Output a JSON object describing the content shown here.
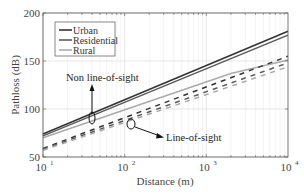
{
  "chart_data": {
    "type": "line",
    "title": "",
    "xlabel": "Distance (m)",
    "ylabel": "Pathloss (dB)",
    "xscale": "log",
    "xlim": [
      10,
      10000
    ],
    "ylim": [
      50,
      200
    ],
    "xticks": [
      10,
      100,
      1000,
      10000
    ],
    "xtick_labels": [
      "10",
      "10",
      "10",
      "10"
    ],
    "xtick_exponents": [
      "1",
      "2",
      "3",
      "4"
    ],
    "yticks": [
      50,
      100,
      150,
      200
    ],
    "ytick_labels": [
      "50",
      "100",
      "150",
      "200"
    ],
    "grid": true,
    "legend_position": "upper left",
    "legend": [
      {
        "label": "Urban",
        "color": "#333333"
      },
      {
        "label": "Residential",
        "color": "#5a5a5a"
      },
      {
        "label": "Rural",
        "color": "#aaaaaa"
      }
    ],
    "series": [
      {
        "name": "Urban (Non line-of-sight)",
        "style": "solid",
        "color": "#333333",
        "x": [
          10,
          10000
        ],
        "y": [
          74,
          181
        ]
      },
      {
        "name": "Residential (Non line-of-sight)",
        "style": "solid",
        "color": "#5a5a5a",
        "x": [
          10,
          10000
        ],
        "y": [
          72,
          177
        ]
      },
      {
        "name": "Rural (Non line-of-sight)",
        "style": "solid",
        "color": "#aaaaaa",
        "x": [
          10,
          2000,
          10000
        ],
        "y": [
          70,
          137,
          151
        ]
      },
      {
        "name": "Urban (Line-of-sight)",
        "style": "dashed",
        "color": "#333333",
        "x": [
          10,
          10000
        ],
        "y": [
          59,
          155
        ]
      },
      {
        "name": "Residential (Line-of-sight)",
        "style": "dashed",
        "color": "#5a5a5a",
        "x": [
          10,
          10000
        ],
        "y": [
          58,
          148
        ]
      },
      {
        "name": "Rural (Line-of-sight)",
        "style": "dashed",
        "color": "#aaaaaa",
        "x": [
          10,
          10000
        ],
        "y": [
          57,
          144
        ]
      }
    ],
    "annotations": [
      {
        "text": "Non line-of-sight",
        "x": 44,
        "y": 92,
        "points_to": "solid lines"
      },
      {
        "text": "Line-of-sight",
        "x": 120,
        "y": 85,
        "points_to": "dashed lines"
      }
    ]
  }
}
